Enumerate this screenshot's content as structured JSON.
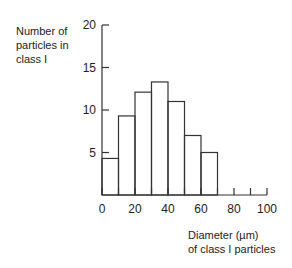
{
  "chart_data": {
    "type": "bar",
    "subtype": "histogram",
    "title": "",
    "ylabel": "Number of\nparticles in\nclass I",
    "xlabel": "Diameter (µm)\nof class I particles",
    "bins": [
      [
        0,
        10
      ],
      [
        10,
        20
      ],
      [
        20,
        30
      ],
      [
        30,
        40
      ],
      [
        40,
        50
      ],
      [
        50,
        60
      ],
      [
        60,
        70
      ]
    ],
    "categories": [
      "0-10",
      "10-20",
      "20-30",
      "30-40",
      "40-50",
      "50-60",
      "60-70"
    ],
    "values": [
      4.3,
      9.3,
      12.1,
      13.3,
      11.0,
      7.0,
      5.0
    ],
    "xlim": [
      0,
      100
    ],
    "ylim": [
      0,
      20
    ],
    "xticks": [
      0,
      10,
      20,
      30,
      40,
      50,
      60,
      70,
      80,
      90,
      100
    ],
    "xtick_labels": [
      "0",
      "20",
      "40",
      "60",
      "80",
      "100"
    ],
    "xtick_label_values": [
      0,
      20,
      40,
      60,
      80,
      100
    ],
    "yticks": [
      5,
      10,
      15,
      20
    ],
    "ytick_labels": [
      "5",
      "10",
      "15",
      "20"
    ],
    "grid": false,
    "legend": null
  }
}
